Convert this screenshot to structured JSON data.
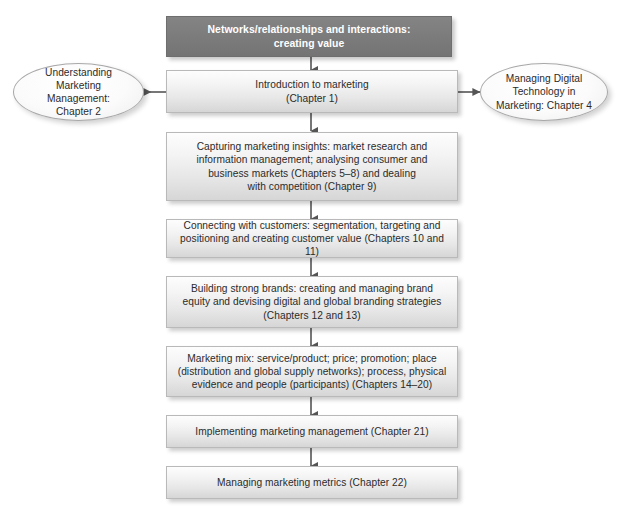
{
  "diagram": {
    "accent_dark": "#7b7b7b",
    "accent_box": "#eeeeee",
    "connector_color": "#555555",
    "border_color": "#b9b9b9",
    "background": "#ffffff"
  },
  "nodes": {
    "header": {
      "label": "Networks/relationships and interactions:\ncreating value",
      "shape": "rect-dark"
    },
    "intro": {
      "label": "Introduction to marketing\n(Chapter 1)",
      "shape": "rect"
    },
    "left_ellipse": {
      "label": "Understanding\nMarketing Management:\nChapter 2",
      "shape": "ellipse"
    },
    "right_ellipse": {
      "label": "Managing Digital\nTechnology in\nMarketing: Chapter 4",
      "shape": "ellipse"
    },
    "insights": {
      "label": "Capturing marketing insights: market research and\ninformation management; analysing consumer and\nbusiness markets (Chapters 5–8) and dealing\nwith competition (Chapter 9)",
      "shape": "rect"
    },
    "customers": {
      "label": "Connecting with customers: segmentation, targeting and\npositioning and creating customer value (Chapters 10 and 11)",
      "shape": "rect"
    },
    "brands": {
      "label": "Building strong brands: creating and managing brand\nequity and devising digital and global branding strategies\n(Chapters 12 and 13)",
      "shape": "rect"
    },
    "mix": {
      "label": "Marketing mix: service/product; price; promotion; place\n(distribution and global supply networks); process, physical\nevidence and people (participants) (Chapters 14–20)",
      "shape": "rect"
    },
    "implementing": {
      "label": "Implementing marketing management (Chapter 21)",
      "shape": "rect"
    },
    "metrics": {
      "label": "Managing marketing metrics (Chapter 22)",
      "shape": "rect"
    }
  },
  "connectors": [
    {
      "name": "header-to-intro",
      "kind": "arrow-down"
    },
    {
      "name": "intro-to-left-ellipse",
      "kind": "arrow-left"
    },
    {
      "name": "intro-to-right-ellipse",
      "kind": "arrow-right"
    },
    {
      "name": "intro-to-insights",
      "kind": "arrow-down"
    },
    {
      "name": "insights-to-customers",
      "kind": "arrow-down"
    },
    {
      "name": "customers-to-brands",
      "kind": "arrow-down"
    },
    {
      "name": "brands-to-mix",
      "kind": "arrow-down"
    },
    {
      "name": "mix-to-implementing",
      "kind": "arrow-down"
    },
    {
      "name": "implementing-to-metrics",
      "kind": "arrow-down"
    }
  ]
}
